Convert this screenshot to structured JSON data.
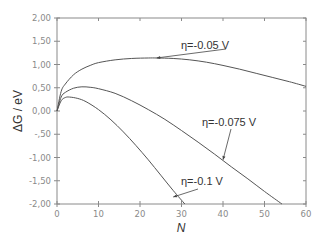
{
  "chart_data": {
    "type": "line",
    "title": "",
    "xlabel": "N",
    "ylabel": "ΔG / eV",
    "xlim": [
      0,
      60
    ],
    "ylim": [
      -2.0,
      2.0
    ],
    "grid": false,
    "legend_position": "none (inline annotations)",
    "x_ticks": [
      "0",
      "10",
      "20",
      "30",
      "40",
      "50",
      "60"
    ],
    "y_ticks": [
      "2,00",
      "1,50",
      "1,00",
      "0,50",
      "0,00",
      "-,50",
      "-1,00",
      "-1,50",
      "-2,00"
    ],
    "series": [
      {
        "name": "η=-0.05 V",
        "x": [
          0,
          1,
          2,
          4,
          6,
          8,
          10,
          14,
          18,
          22,
          24,
          28,
          32,
          36,
          40,
          44,
          48,
          52,
          56,
          60
        ],
        "values": [
          0.0,
          0.42,
          0.58,
          0.78,
          0.9,
          0.98,
          1.04,
          1.1,
          1.13,
          1.14,
          1.14,
          1.13,
          1.1,
          1.05,
          0.98,
          0.9,
          0.81,
          0.72,
          0.63,
          0.53
        ]
      },
      {
        "name": "η=-0.075 V",
        "x": [
          0,
          1,
          2,
          4,
          6,
          8,
          10,
          14,
          18,
          22,
          26,
          30,
          34,
          38,
          42,
          46,
          50,
          54.2
        ],
        "values": [
          0.0,
          0.3,
          0.4,
          0.49,
          0.52,
          0.51,
          0.48,
          0.38,
          0.22,
          0.03,
          -0.18,
          -0.42,
          -0.67,
          -0.93,
          -1.2,
          -1.46,
          -1.73,
          -2.0
        ]
      },
      {
        "name": "η=-0.1 V",
        "x": [
          0,
          1,
          2,
          3,
          5,
          7,
          10,
          13,
          16,
          19,
          22,
          25,
          28,
          30.8
        ],
        "values": [
          0.0,
          0.22,
          0.29,
          0.3,
          0.27,
          0.2,
          0.03,
          -0.19,
          -0.45,
          -0.74,
          -1.05,
          -1.38,
          -1.71,
          -2.0
        ]
      }
    ],
    "annotations": [
      {
        "text": "η=-0.05 V",
        "arrow_to": [
          24,
          1.14
        ]
      },
      {
        "text": "η=-0.075 V",
        "arrow_to": [
          40,
          -1.05
        ]
      },
      {
        "text": "η=-0.1 V",
        "arrow_to": [
          28,
          -1.85
        ]
      }
    ]
  }
}
